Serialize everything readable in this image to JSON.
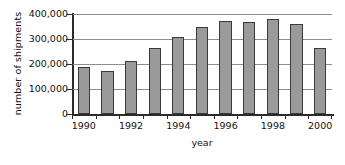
{
  "chart_data": {
    "type": "bar",
    "title": "",
    "xlabel": "year",
    "ylabel": "number of shipments",
    "categories": [
      "1990",
      "1991",
      "1992",
      "1993",
      "1994",
      "1995",
      "1996",
      "1997",
      "1998",
      "1999",
      "2000"
    ],
    "values": [
      190000,
      172000,
      213000,
      265000,
      310000,
      348000,
      372000,
      367000,
      382000,
      360000,
      263000
    ],
    "ylim": [
      0,
      400000
    ],
    "xlim_categories": 11,
    "y_ticks": [
      0,
      100000,
      200000,
      300000,
      400000
    ],
    "y_tick_labels": [
      "0",
      "100,000",
      "200,000",
      "300,000",
      "400,000"
    ],
    "x_tick_labels_shown": [
      "1990",
      "1992",
      "1994",
      "1996",
      "1998",
      "2000"
    ],
    "x_tick_label_indices": [
      0,
      2,
      4,
      6,
      8,
      10
    ],
    "grid": true,
    "grid_axis": "y",
    "legend": false,
    "legend_position": "none",
    "bar_fill_color": "#9a9a9a",
    "bar_edge_color": "#3a3a3a",
    "grid_color": "#8d8d8d",
    "axis_color": "#2b2b2b",
    "background_color": "#ffffff"
  },
  "axes": {
    "y_title": "number of shipments",
    "x_title": "year"
  }
}
